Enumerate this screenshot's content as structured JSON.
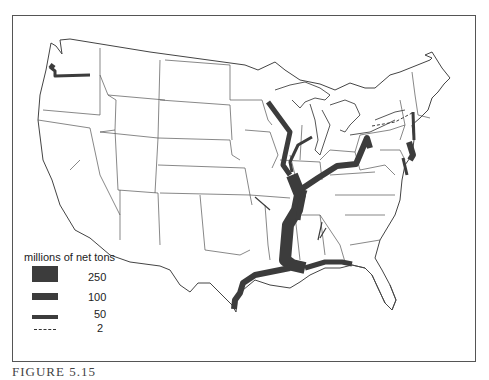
{
  "figure": {
    "caption": "FIGURE 5.15",
    "map_subject": "United States inland waterway freight flows"
  },
  "legend": {
    "title": "millions of net tons",
    "items": [
      {
        "label": "250",
        "style": "thick-bar"
      },
      {
        "label": "100",
        "style": "medium-bar"
      },
      {
        "label": "50",
        "style": "thin-bar"
      },
      {
        "label": "2",
        "style": "dashed-line"
      }
    ]
  },
  "colors": {
    "flow": "#3c3c3c",
    "border": "#555555",
    "state_lines": "#444444"
  },
  "waterways": [
    {
      "name": "Columbia River",
      "magnitude": "50-100"
    },
    {
      "name": "Upper Mississippi River",
      "magnitude": "50-100"
    },
    {
      "name": "Illinois Waterway",
      "magnitude": "50"
    },
    {
      "name": "Ohio River",
      "magnitude": "100"
    },
    {
      "name": "Lower Mississippi River",
      "magnitude": "250"
    },
    {
      "name": "Gulf Intracoastal Waterway",
      "magnitude": "100"
    },
    {
      "name": "Hudson River",
      "magnitude": "50"
    },
    {
      "name": "Delaware River",
      "magnitude": "100"
    },
    {
      "name": "Chesapeake Bay",
      "magnitude": "50"
    },
    {
      "name": "New York State Barge Canal",
      "magnitude": "2"
    }
  ]
}
